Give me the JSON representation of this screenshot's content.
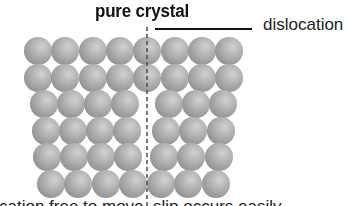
{
  "diagram": {
    "title": "pure crystal",
    "callout_label": "dislocation",
    "caption": "cation free to move, slip occurs easily",
    "colors": {
      "atom_light": "#d4d4d4",
      "atom_mid": "#acacac",
      "atom_dark": "#858585",
      "dashed_line": "#555555",
      "text": "#111111"
    },
    "atom_radius": 14,
    "dislocation_line": {
      "x": 147,
      "y_start": 27,
      "y_end": 206
    },
    "rows": [
      {
        "cy": 51,
        "cx": [
          38,
          65,
          93,
          120,
          147,
          175,
          202,
          229
        ]
      },
      {
        "cy": 78,
        "cx": [
          38,
          65,
          93,
          120,
          147,
          175,
          202,
          229
        ]
      },
      {
        "cy": 104,
        "cx": [
          44,
          71,
          98,
          125,
          169,
          196,
          223
        ]
      },
      {
        "cy": 131,
        "cx": [
          46,
          73,
          100,
          127,
          166,
          193,
          221
        ]
      },
      {
        "cy": 157,
        "cx": [
          47,
          74,
          101,
          128,
          164,
          191,
          219
        ]
      },
      {
        "cy": 184,
        "cx": [
          51,
          78,
          106,
          133,
          161,
          188,
          216
        ]
      }
    ]
  }
}
